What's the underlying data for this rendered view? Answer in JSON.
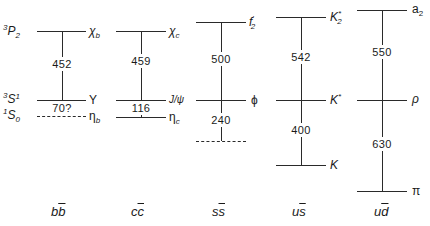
{
  "diagram": {
    "title": "",
    "spectroscopic_labels": [
      {
        "pre": "3",
        "main": "P",
        "sub": "2"
      },
      {
        "pre": "3",
        "main": "S",
        "sub": "1"
      },
      {
        "pre": "1",
        "main": "S",
        "sub": "0"
      }
    ],
    "columns": [
      {
        "flavor": "bb̄",
        "flavor_q": "b",
        "flavor_qbar": "b",
        "states": [
          "χ",
          "Υ",
          "η"
        ],
        "state_subs": [
          "b",
          "",
          "b"
        ],
        "splittings": [
          "452",
          "70?"
        ]
      },
      {
        "flavor": "cc̄",
        "flavor_q": "c",
        "flavor_qbar": "c",
        "states": [
          "χ",
          "J/ψ",
          "η"
        ],
        "state_subs": [
          "c",
          "",
          "c"
        ],
        "splittings": [
          "459",
          "116"
        ]
      },
      {
        "flavor": "ss̄",
        "flavor_q": "s",
        "flavor_qbar": "s",
        "states": [
          "f",
          "ϕ",
          ""
        ],
        "state_subs": [
          "2",
          "",
          ""
        ],
        "state_sups": [
          "′",
          "",
          ""
        ],
        "splittings": [
          "500",
          "240"
        ]
      },
      {
        "flavor": "us̄",
        "flavor_q": "u",
        "flavor_qbar": "s",
        "states": [
          "K",
          "K",
          "K"
        ],
        "state_subs": [
          "2",
          "",
          ""
        ],
        "state_sups": [
          "*",
          "*",
          ""
        ],
        "splittings": [
          "542",
          "400"
        ]
      },
      {
        "flavor": "ud̄",
        "flavor_q": "u",
        "flavor_qbar": "d",
        "states": [
          "a",
          "ρ",
          "π"
        ],
        "state_subs": [
          "2",
          "",
          ""
        ],
        "splittings": [
          "550",
          "630"
        ]
      }
    ]
  }
}
